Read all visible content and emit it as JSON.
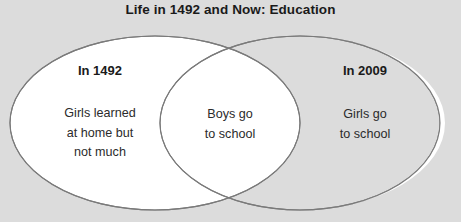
{
  "diagram": {
    "type": "venn",
    "title": "Life in 1492 and Now: Education",
    "background_color": "#dcdcdc",
    "circle_fill_color": "#ffffff",
    "circle_stroke_color": "#7a7a7a",
    "text_color": "#1a1a1a",
    "left_set": {
      "heading": "In 1492",
      "body_lines": [
        "Girls learned",
        "at home but",
        "not much"
      ],
      "body_text": "Girls learned at home but not much"
    },
    "right_set": {
      "heading": "In 2009",
      "body_lines": [
        "Girls go",
        "to school"
      ],
      "body_text": "Girls go to school"
    },
    "intersection": {
      "heading": "",
      "body_lines": [
        "Boys go",
        "to school"
      ],
      "body_text": "Boys go to school"
    }
  }
}
